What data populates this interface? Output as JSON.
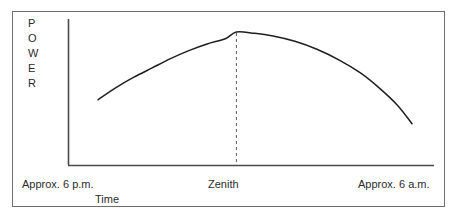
{
  "chart_data": {
    "type": "line",
    "title": "",
    "subtitle": "",
    "xlabel": "Time",
    "ylabel": "POWER",
    "ylabel_letters": [
      "P",
      "O",
      "W",
      "E",
      "R"
    ],
    "xtick_labels": [
      "Approx. 6 p.m.",
      "Zenith",
      "Approx. 6 a.m."
    ],
    "ytick_labels": [],
    "grid": false,
    "legend": null,
    "annotations": [
      {
        "name": "zenith-guide",
        "text": "Zenith",
        "style": "dashed-vertical-line",
        "x_fraction": 0.46
      }
    ],
    "axis_ranges": {
      "x": [
        0,
        1
      ],
      "y": [
        0,
        1
      ]
    },
    "series": [
      {
        "name": "power",
        "x": [
          0.082,
          0.13,
          0.18,
          0.23,
          0.28,
          0.33,
          0.38,
          0.43,
          0.46,
          0.51,
          0.56,
          0.62,
          0.68,
          0.74,
          0.8,
          0.85,
          0.9,
          0.94
        ],
        "y": [
          0.49,
          0.58,
          0.66,
          0.73,
          0.8,
          0.86,
          0.91,
          0.95,
          1.0,
          0.99,
          0.97,
          0.93,
          0.87,
          0.79,
          0.69,
          0.58,
          0.45,
          0.31
        ]
      }
    ]
  },
  "figure": {
    "frame_color": "#6e6e6e",
    "curve_color": "#1f1f1f",
    "axis_color": "#4a4a4a",
    "dash_color": "#5a5a5a",
    "text_color": "#2b2b2b",
    "background": "#ffffff"
  },
  "labels": {
    "y_axis": "POWER",
    "x_axis": "Time",
    "left_tick": "Approx. 6 p.m.",
    "center_tick": "Zenith",
    "right_tick": "Approx. 6 a.m."
  }
}
